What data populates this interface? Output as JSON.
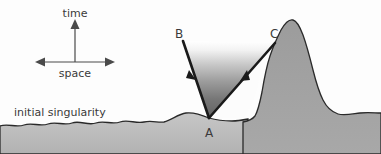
{
  "figure": {
    "background_color": "#fdfdfd",
    "width": 381,
    "height": 154
  },
  "axes": {
    "time_label": "time",
    "space_label": "space",
    "vertical_arrow_icon": "arrow-up-icon",
    "horizontal_arrow_icon": "arrow-left-right-icon",
    "origin": {
      "x": 75,
      "y": 62
    },
    "time_axis": {
      "x1": 75,
      "y1": 62,
      "x2": 75,
      "y2": 22
    },
    "space_axis": {
      "x1": 38,
      "y1": 62,
      "x2": 112,
      "y2": 62
    }
  },
  "caption": {
    "initial_singularity_label": "initial singularity",
    "position": {
      "x": 14,
      "y": 116
    }
  },
  "points": [
    {
      "id": "A",
      "label": "A",
      "x": 209,
      "y": 118,
      "label_x": 206,
      "label_y": 136,
      "role": "cone-vertex"
    },
    {
      "id": "B",
      "label": "B",
      "x": 183,
      "y": 41,
      "label_x": 175,
      "label_y": 38,
      "role": "left-ray-endpoint"
    },
    {
      "id": "C",
      "label": "C",
      "x": 275,
      "y": 43,
      "label_x": 272,
      "label_y": 38,
      "role": "right-ray-endpoint"
    }
  ],
  "rays": [
    {
      "name": "ray-a-to-b",
      "from": "A",
      "to": "B",
      "arrow_icon": "arrowhead-icon",
      "arrow_at": {
        "x": 190,
        "y": 74
      }
    },
    {
      "name": "ray-a-to-c",
      "from": "A",
      "to": "C",
      "arrow_icon": "arrowhead-icon",
      "arrow_at": {
        "x": 244,
        "y": 76
      }
    }
  ],
  "cones": [
    {
      "name": "shaded-light-cone",
      "fill_type": "vertical-gradient",
      "fill_top_color": "#ffffff",
      "fill_bottom_color": "#636363",
      "description": "Shaded cone between A, B and C"
    },
    {
      "name": "white-light-cone",
      "fill_type": "solid",
      "fill_color": "#fcfcfc",
      "description": "White cone between A and C"
    }
  ],
  "terrain": {
    "ground_fill_color": "#bdbdbd",
    "mountain_fill_color": "#9a9a9a",
    "outline_color": "#2a2a2a",
    "baseline_y": 122
  },
  "colors": {
    "ink": "#1a1a1a",
    "text": "#3a3a3a",
    "ground": "#bdbdbd",
    "mountain": "#9a9a9a",
    "cone_dark": "#636363",
    "cone_light": "#ffffff"
  }
}
